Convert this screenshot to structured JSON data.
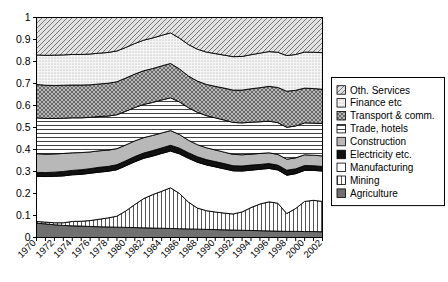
{
  "chart_data": {
    "type": "area",
    "stacked": true,
    "normalized": true,
    "title": "",
    "subtitle": "",
    "xlabel": "",
    "ylabel": "",
    "xlim": [
      1970,
      2002
    ],
    "ylim": [
      0,
      1
    ],
    "grid": false,
    "legend_position": "right",
    "x": [
      1970,
      1971,
      1972,
      1973,
      1974,
      1975,
      1976,
      1977,
      1978,
      1979,
      1980,
      1981,
      1982,
      1983,
      1984,
      1985,
      1986,
      1987,
      1988,
      1989,
      1990,
      1991,
      1992,
      1993,
      1994,
      1995,
      1996,
      1997,
      1998,
      1999,
      2000,
      2001,
      2002
    ],
    "ytick_labels": [
      "0",
      "0.1",
      "0.2",
      "0.3",
      "0.4",
      "0.5",
      "0.6",
      "0.7",
      "0.8",
      "0.9",
      "1"
    ],
    "ytick_values": [
      0,
      0.1,
      0.2,
      0.3,
      0.4,
      0.5,
      0.6,
      0.7,
      0.8,
      0.9,
      1
    ],
    "xtick_labels": [
      "1970",
      "1972",
      "1974",
      "1976",
      "1978",
      "1980",
      "1982",
      "1984",
      "1986",
      "1988",
      "1990",
      "1992",
      "1994",
      "1996",
      "1998",
      "2000",
      "2002"
    ],
    "xtick_values": [
      1970,
      1972,
      1974,
      1976,
      1978,
      1980,
      1982,
      1984,
      1986,
      1988,
      1990,
      1992,
      1994,
      1996,
      1998,
      2000,
      2002
    ],
    "stack_order_bottom_to_top": [
      "Agriculture",
      "Mining",
      "Manufacturing",
      "Electricity etc.",
      "Construction",
      "Trade, hotels",
      "Transport & comm.",
      "Finance etc",
      "Oth. Services"
    ],
    "series": [
      {
        "name": "Agriculture",
        "pattern": "solid-dark-gray",
        "color": "#707070",
        "values": [
          0.065,
          0.062,
          0.058,
          0.055,
          0.053,
          0.052,
          0.05,
          0.049,
          0.048,
          0.047,
          0.046,
          0.045,
          0.044,
          0.043,
          0.042,
          0.041,
          0.04,
          0.039,
          0.038,
          0.037,
          0.036,
          0.035,
          0.034,
          0.033,
          0.032,
          0.031,
          0.03,
          0.029,
          0.028,
          0.028,
          0.027,
          0.027,
          0.026
        ]
      },
      {
        "name": "Mining",
        "pattern": "vertical-lines",
        "color": "#ffffff",
        "values": [
          0.008,
          0.008,
          0.009,
          0.012,
          0.02,
          0.022,
          0.027,
          0.034,
          0.041,
          0.05,
          0.075,
          0.105,
          0.133,
          0.152,
          0.168,
          0.185,
          0.16,
          0.122,
          0.096,
          0.085,
          0.08,
          0.076,
          0.073,
          0.083,
          0.104,
          0.121,
          0.132,
          0.127,
          0.081,
          0.104,
          0.137,
          0.142,
          0.138
        ]
      },
      {
        "name": "Manufacturing",
        "pattern": "white",
        "color": "#ffffff",
        "values": [
          0.205,
          0.207,
          0.211,
          0.213,
          0.212,
          0.213,
          0.215,
          0.214,
          0.212,
          0.211,
          0.205,
          0.194,
          0.183,
          0.175,
          0.172,
          0.167,
          0.18,
          0.199,
          0.208,
          0.208,
          0.205,
          0.201,
          0.196,
          0.186,
          0.17,
          0.158,
          0.152,
          0.151,
          0.174,
          0.158,
          0.141,
          0.136,
          0.138
        ]
      },
      {
        "name": "Electricity etc.",
        "pattern": "solid-black",
        "color": "#111111",
        "values": [
          0.018,
          0.018,
          0.019,
          0.02,
          0.02,
          0.021,
          0.021,
          0.022,
          0.022,
          0.023,
          0.023,
          0.024,
          0.024,
          0.025,
          0.025,
          0.026,
          0.026,
          0.025,
          0.025,
          0.024,
          0.024,
          0.024,
          0.023,
          0.023,
          0.023,
          0.022,
          0.022,
          0.022,
          0.023,
          0.022,
          0.022,
          0.021,
          0.021
        ]
      },
      {
        "name": "Construction",
        "pattern": "solid-light-gray",
        "color": "#b8b8b8",
        "values": [
          0.085,
          0.084,
          0.083,
          0.082,
          0.08,
          0.078,
          0.076,
          0.075,
          0.074,
          0.073,
          0.072,
          0.071,
          0.07,
          0.069,
          0.068,
          0.067,
          0.062,
          0.057,
          0.055,
          0.054,
          0.053,
          0.052,
          0.052,
          0.051,
          0.05,
          0.05,
          0.049,
          0.049,
          0.05,
          0.05,
          0.049,
          0.048,
          0.048
        ]
      },
      {
        "name": "Trade, hotels",
        "pattern": "horizontal-lines",
        "color": "#ffffff",
        "values": [
          0.163,
          0.162,
          0.161,
          0.16,
          0.159,
          0.158,
          0.157,
          0.156,
          0.155,
          0.154,
          0.153,
          0.152,
          0.151,
          0.15,
          0.15,
          0.149,
          0.148,
          0.148,
          0.147,
          0.146,
          0.146,
          0.146,
          0.145,
          0.145,
          0.145,
          0.144,
          0.144,
          0.144,
          0.145,
          0.145,
          0.145,
          0.146,
          0.147
        ]
      },
      {
        "name": "Transport & comm.",
        "pattern": "cross-hatch",
        "color": "#999999",
        "values": [
          0.152,
          0.151,
          0.15,
          0.15,
          0.149,
          0.149,
          0.148,
          0.148,
          0.149,
          0.15,
          0.151,
          0.152,
          0.153,
          0.154,
          0.155,
          0.156,
          0.15,
          0.144,
          0.142,
          0.142,
          0.143,
          0.145,
          0.147,
          0.149,
          0.152,
          0.155,
          0.158,
          0.16,
          0.164,
          0.162,
          0.158,
          0.157,
          0.156
        ]
      },
      {
        "name": "Finance etc",
        "pattern": "fine-dots",
        "color": "#ececec",
        "values": [
          0.134,
          0.136,
          0.138,
          0.138,
          0.139,
          0.139,
          0.14,
          0.14,
          0.14,
          0.14,
          0.139,
          0.139,
          0.139,
          0.139,
          0.139,
          0.139,
          0.14,
          0.143,
          0.145,
          0.147,
          0.149,
          0.15,
          0.152,
          0.153,
          0.155,
          0.157,
          0.158,
          0.16,
          0.162,
          0.163,
          0.164,
          0.165,
          0.166
        ]
      },
      {
        "name": "Oth. Services",
        "pattern": "diagonal-hatch",
        "color": "#d8d8d8",
        "values": [
          0.17,
          0.172,
          0.171,
          0.17,
          0.168,
          0.168,
          0.166,
          0.162,
          0.159,
          0.152,
          0.136,
          0.118,
          0.103,
          0.093,
          0.081,
          0.07,
          0.094,
          0.123,
          0.144,
          0.157,
          0.164,
          0.171,
          0.178,
          0.177,
          0.169,
          0.162,
          0.155,
          0.158,
          0.173,
          0.168,
          0.157,
          0.158,
          0.16
        ]
      }
    ]
  },
  "legend": {
    "items": [
      {
        "label": "Oth. Services",
        "pattern": "diagonal-hatch"
      },
      {
        "label": "Finance etc",
        "pattern": "fine-dots"
      },
      {
        "label": "Transport & comm.",
        "pattern": "cross-hatch"
      },
      {
        "label": "Trade, hotels",
        "pattern": "horizontal-lines"
      },
      {
        "label": "Construction",
        "pattern": "solid-light-gray"
      },
      {
        "label": "Electricity etc.",
        "pattern": "solid-black"
      },
      {
        "label": "Manufacturing",
        "pattern": "white"
      },
      {
        "label": "Mining",
        "pattern": "vertical-lines"
      },
      {
        "label": "Agriculture",
        "pattern": "solid-dark-gray"
      }
    ]
  },
  "colors": {
    "axis": "#000000",
    "background": "#ffffff",
    "agriculture": "#707070",
    "electricity": "#111111",
    "construction": "#b8b8b8",
    "transport": "#999999",
    "finance": "#ececec",
    "other_services": "#d8d8d8"
  }
}
